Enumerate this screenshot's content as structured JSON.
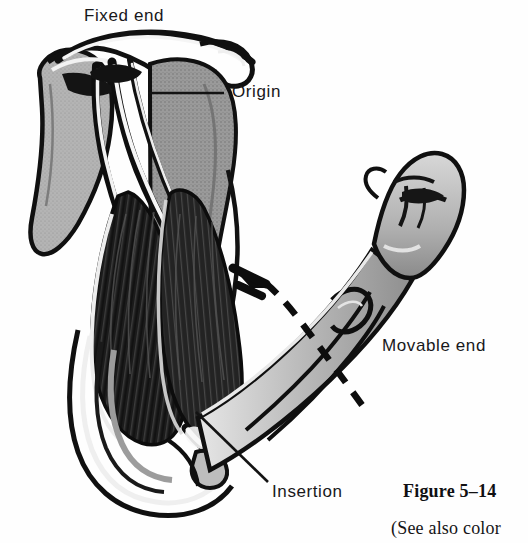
{
  "figure": {
    "caption": "Figure 5–14",
    "caption_continued": "(See also color",
    "background_color": "#fefefe",
    "ink_color": "#18181a"
  },
  "labels": {
    "fixed_end": "Fixed end",
    "origin": "Origin",
    "movable_end": "Movable end",
    "insertion": "Insertion"
  },
  "illustration": {
    "subject": "flexed-arm-muscle-attachment",
    "parts": [
      "scapula",
      "clavicle",
      "acromion-process",
      "humerus",
      "biceps-brachii-muscle",
      "tendon-of-origin",
      "tendon-of-insertion",
      "radius",
      "ulna",
      "clenched-fist"
    ],
    "movement_arrow": {
      "style": "dashed-curved-arrow",
      "direction": "upward-left",
      "meaning": "flexion"
    },
    "tones": {
      "muscle_dark": "#1c1c1c",
      "bone_mid": "#a9a9a9",
      "bone_light": "#cfcfcf",
      "highlight": "#f4f4f4",
      "outline": "#111111"
    }
  }
}
